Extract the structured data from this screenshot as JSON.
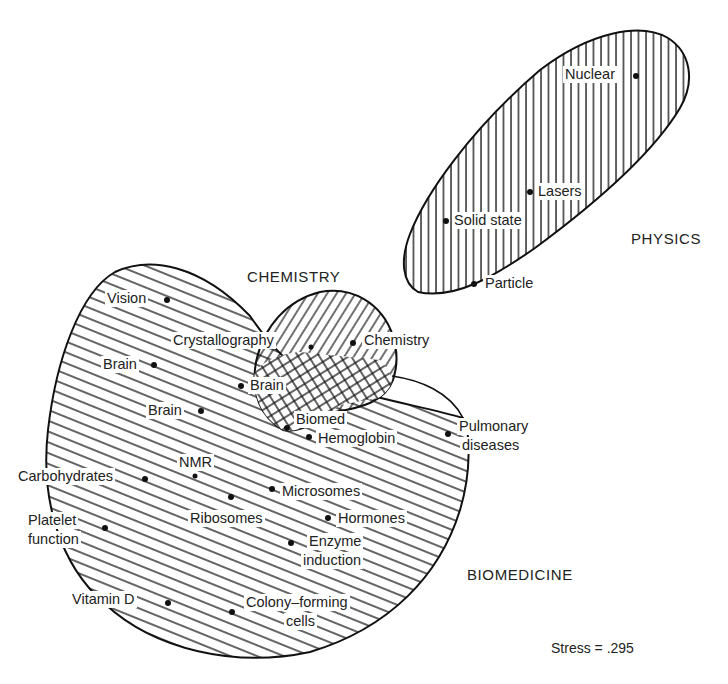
{
  "diagram": {
    "type": "multidimensional-scaling cluster map",
    "regions": [
      {
        "name": "PHYSICS",
        "pattern": "vertical-hatch"
      },
      {
        "name": "CHEMISTRY",
        "pattern": "diagonal-hatch"
      },
      {
        "name": "BIOMEDICINE",
        "pattern": "horizontal-diagonal-hatch"
      }
    ],
    "overlap_pattern": "crosshatch",
    "points": {
      "nuclear": "Nuclear",
      "lasers": "Lasers",
      "solid_state": "Solid state",
      "particle": "Particle",
      "chemistry": "Chemistry",
      "crystallography": "Crystallography",
      "vision": "Vision",
      "brain1": "Brain",
      "brain2": "Brain",
      "brain3": "Brain",
      "biomed": "Biomed",
      "hemoglobin": "Hemoglobin",
      "pulmonary_1": "Pulmonary",
      "pulmonary_2": "diseases",
      "carbohydrates": "Carbohydrates",
      "nmr": "NMR",
      "microsomes": "Microsomes",
      "ribosomes": "Ribosomes",
      "hormones": "Hormones",
      "platelet_1": "Platelet",
      "platelet_2": "function",
      "enzyme_1": "Enzyme",
      "enzyme_2": "induction",
      "vitamin_d": "Vitamin  D",
      "colony_1": "Colony–forming",
      "colony_2": "cells"
    },
    "region_labels": {
      "physics": "PHYSICS",
      "chemistry": "CHEMISTRY",
      "biomedicine": "BIOMEDICINE"
    },
    "stress": "Stress  =  .295"
  }
}
